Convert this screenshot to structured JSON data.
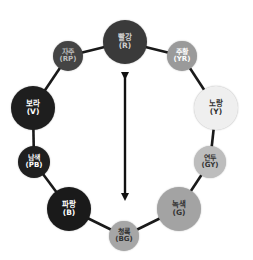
{
  "diagram": {
    "type": "color-wheel",
    "ring_color": "#1a1a1a",
    "arrow": {
      "from": [
        125,
        72
      ],
      "to": [
        125,
        201
      ],
      "color": "#111111",
      "meaning": "complementary-colors"
    },
    "nodes": [
      {
        "id": "R",
        "name": "빨강",
        "code": "(R)",
        "cx": 125,
        "cy": 42,
        "r": 22,
        "fill": "#3a3a3a",
        "text": "#cfcfcf",
        "size": 7.5
      },
      {
        "id": "YR",
        "name": "주황",
        "code": "(YR)",
        "cx": 182,
        "cy": 56,
        "r": 15,
        "fill": "#9a9a9a",
        "text": "#ffffff",
        "size": 7
      },
      {
        "id": "Y",
        "name": "노랑",
        "code": "(Y)",
        "cx": 216,
        "cy": 108,
        "r": 22,
        "fill": "#efefef",
        "text": "#333333",
        "size": 7.5
      },
      {
        "id": "GY",
        "name": "연두",
        "code": "(GY)",
        "cx": 210,
        "cy": 162,
        "r": 16,
        "fill": "#bdbdbd",
        "text": "#333333",
        "size": 7
      },
      {
        "id": "G",
        "name": "녹색",
        "code": "(G)",
        "cx": 179,
        "cy": 209,
        "r": 22,
        "fill": "#a3a3a3",
        "text": "#333333",
        "size": 7.5
      },
      {
        "id": "BG",
        "name": "청록",
        "code": "(BG)",
        "cx": 124,
        "cy": 236,
        "r": 15,
        "fill": "#a6a6a6",
        "text": "#333333",
        "size": 7
      },
      {
        "id": "B",
        "name": "파랑",
        "code": "(B)",
        "cx": 69,
        "cy": 209,
        "r": 22,
        "fill": "#1a1a1a",
        "text": "#ffffff",
        "size": 7.5
      },
      {
        "id": "PB",
        "name": "남색",
        "code": "(PB)",
        "cx": 34,
        "cy": 162,
        "r": 16,
        "fill": "#1f1f1f",
        "text": "#ffffff",
        "size": 7
      },
      {
        "id": "V",
        "name": "보라",
        "code": "(V)",
        "cx": 33,
        "cy": 108,
        "r": 22,
        "fill": "#1e1e1e",
        "text": "#ffffff",
        "size": 7.5
      },
      {
        "id": "RP",
        "name": "자주",
        "code": "(RP)",
        "cx": 68,
        "cy": 56,
        "r": 15,
        "fill": "#444444",
        "text": "#bdbdbd",
        "size": 7
      }
    ]
  }
}
